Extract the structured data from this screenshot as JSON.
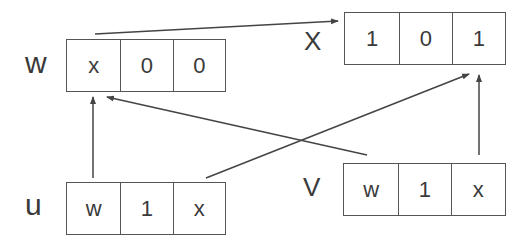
{
  "diagram": {
    "nodes": {
      "w": {
        "label": "w",
        "cells": [
          "x",
          "0",
          "0"
        ]
      },
      "x": {
        "label": "X",
        "cells": [
          "1",
          "0",
          "1"
        ]
      },
      "u": {
        "label": "u",
        "cells": [
          "w",
          "1",
          "x"
        ]
      },
      "v": {
        "label": "V",
        "cells": [
          "w",
          "1",
          "x"
        ]
      }
    },
    "edges": [
      {
        "from": "w",
        "to": "x",
        "desc": "w top to x record"
      },
      {
        "from": "u.cell0",
        "to": "w.cell0"
      },
      {
        "from": "v.cell0",
        "to": "w.cell0"
      },
      {
        "from": "u.cell2",
        "to": "x.cell2"
      },
      {
        "from": "v.cell2",
        "to": "x.cell2"
      }
    ],
    "colors": {
      "line": "#444444",
      "text": "#3a3a3a"
    }
  }
}
